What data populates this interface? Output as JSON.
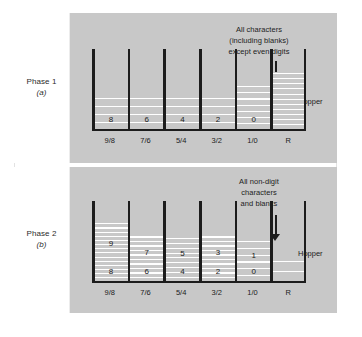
{
  "phases": [
    {
      "id": "phase-1",
      "label": "Phase 1",
      "sub": "(a)",
      "annotation_lines": [
        "All characters",
        "(including blanks)",
        "except even digits"
      ],
      "hopper_label": "Hopper",
      "bins": [
        {
          "caption": "9/8",
          "lower_digit": "8",
          "upper_digit": "",
          "stack_top_pct": 58,
          "stripe_count": 4,
          "hopper": false
        },
        {
          "caption": "7/6",
          "lower_digit": "6",
          "upper_digit": "",
          "stack_top_pct": 58,
          "stripe_count": 4,
          "hopper": false
        },
        {
          "caption": "5/4",
          "lower_digit": "4",
          "upper_digit": "",
          "stack_top_pct": 58,
          "stripe_count": 4,
          "hopper": false
        },
        {
          "caption": "3/2",
          "lower_digit": "2",
          "upper_digit": "",
          "stack_top_pct": 58,
          "stripe_count": 4,
          "hopper": false
        },
        {
          "caption": "1/0",
          "lower_digit": "0",
          "upper_digit": "",
          "stack_top_pct": 44,
          "stripe_count": 7,
          "hopper": false
        },
        {
          "caption": "R",
          "lower_digit": "",
          "upper_digit": "",
          "stack_top_pct": 28,
          "stripe_count": 11,
          "hopper": true
        }
      ]
    },
    {
      "id": "phase-2",
      "label": "Phase 2",
      "sub": "(b)",
      "annotation_lines": [
        "All non-digit",
        "characters",
        "and blanks"
      ],
      "hopper_label": "Hopper",
      "bins": [
        {
          "caption": "9/8",
          "lower_digit": "8",
          "upper_digit": "9",
          "stack_top_pct": 26,
          "stripe_count": 14,
          "hopper": false
        },
        {
          "caption": "7/6",
          "lower_digit": "6",
          "upper_digit": "7",
          "stack_top_pct": 42,
          "stripe_count": 10,
          "hopper": false
        },
        {
          "caption": "5/4",
          "lower_digit": "4",
          "upper_digit": "5",
          "stack_top_pct": 44,
          "stripe_count": 9,
          "hopper": false
        },
        {
          "caption": "3/2",
          "lower_digit": "2",
          "upper_digit": "3",
          "stack_top_pct": 42,
          "stripe_count": 10,
          "hopper": false
        },
        {
          "caption": "1/0",
          "lower_digit": "0",
          "upper_digit": "1",
          "stack_top_pct": 48,
          "stripe_count": 6,
          "hopper": false
        },
        {
          "caption": "R",
          "lower_digit": "",
          "upper_digit": "",
          "stack_top_pct": 72,
          "stripe_count": 2,
          "hopper": true
        }
      ]
    }
  ],
  "geometry": {
    "rack_left": 38,
    "rack_width": 214,
    "bin_pitch": 35.6,
    "wall_width": 2.5
  }
}
